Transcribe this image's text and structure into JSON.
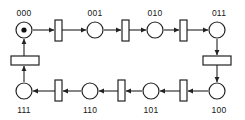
{
  "diagram": {
    "type": "petri-net",
    "background_color": "#ffffff",
    "stroke_color": "#222222",
    "token_color": "#111111",
    "arrow_color": "#222222"
  },
  "places": [
    {
      "id": "p000",
      "label": "000",
      "cx": 24,
      "cy": 30,
      "r": 8,
      "tokens": 1,
      "label_x": 24,
      "label_y": 16,
      "label_pos": "above"
    },
    {
      "id": "p001",
      "label": "001",
      "cx": 95,
      "cy": 30,
      "r": 8,
      "tokens": 0,
      "label_x": 95,
      "label_y": 16,
      "label_pos": "above"
    },
    {
      "id": "p010",
      "label": "010",
      "cx": 155,
      "cy": 30,
      "r": 8,
      "tokens": 0,
      "label_x": 155,
      "label_y": 16,
      "label_pos": "above"
    },
    {
      "id": "p011",
      "label": "011",
      "cx": 217,
      "cy": 30,
      "r": 8,
      "tokens": 0,
      "label_x": 219,
      "label_y": 16,
      "label_pos": "above"
    },
    {
      "id": "p100",
      "label": "100",
      "cx": 217,
      "cy": 91,
      "r": 8,
      "tokens": 0,
      "label_x": 219,
      "label_y": 113,
      "label_pos": "below"
    },
    {
      "id": "p101",
      "label": "101",
      "cx": 151,
      "cy": 91,
      "r": 8,
      "tokens": 0,
      "label_x": 151,
      "label_y": 113,
      "label_pos": "below"
    },
    {
      "id": "p110",
      "label": "110",
      "cx": 90,
      "cy": 91,
      "r": 8,
      "tokens": 0,
      "label_x": 90,
      "label_y": 113,
      "label_pos": "below"
    },
    {
      "id": "p111",
      "label": "111",
      "cx": 24,
      "cy": 91,
      "r": 8,
      "tokens": 0,
      "label_x": 24,
      "label_y": 113,
      "label_pos": "below"
    }
  ],
  "transitions": [
    {
      "id": "t0",
      "orientation": "vertical",
      "x": 55,
      "y": 20,
      "w": 7,
      "h": 21
    },
    {
      "id": "t1",
      "orientation": "vertical",
      "x": 122,
      "y": 20,
      "w": 7,
      "h": 21
    },
    {
      "id": "t2",
      "orientation": "vertical",
      "x": 180,
      "y": 20,
      "w": 7,
      "h": 21
    },
    {
      "id": "t3",
      "orientation": "horizontal",
      "x": 203,
      "y": 56,
      "w": 28,
      "h": 9
    },
    {
      "id": "t4",
      "orientation": "vertical",
      "x": 180,
      "y": 80,
      "w": 7,
      "h": 21
    },
    {
      "id": "t5",
      "orientation": "vertical",
      "x": 118,
      "y": 80,
      "w": 7,
      "h": 21
    },
    {
      "id": "t6",
      "orientation": "vertical",
      "x": 55,
      "y": 80,
      "w": 7,
      "h": 21
    },
    {
      "id": "t7",
      "orientation": "horizontal",
      "x": 11,
      "y": 56,
      "w": 28,
      "h": 9
    }
  ],
  "arcs": [
    {
      "id": "a1",
      "from": "p000",
      "to": "t0",
      "x1": 33,
      "y1": 30,
      "x2": 54,
      "y2": 30
    },
    {
      "id": "a2",
      "from": "t0",
      "to": "p001",
      "x1": 62,
      "y1": 30,
      "x2": 86,
      "y2": 30
    },
    {
      "id": "a3",
      "from": "p001",
      "to": "t1",
      "x1": 104,
      "y1": 30,
      "x2": 121,
      "y2": 30
    },
    {
      "id": "a4",
      "from": "t1",
      "to": "p010",
      "x1": 129,
      "y1": 30,
      "x2": 146,
      "y2": 30
    },
    {
      "id": "a5",
      "from": "p010",
      "to": "t2",
      "x1": 164,
      "y1": 30,
      "x2": 179,
      "y2": 30
    },
    {
      "id": "a6",
      "from": "t2",
      "to": "p011",
      "x1": 187,
      "y1": 30,
      "x2": 208,
      "y2": 30
    },
    {
      "id": "a7",
      "from": "p011",
      "to": "t3",
      "x1": 217,
      "y1": 39,
      "x2": 217,
      "y2": 55
    },
    {
      "id": "a8",
      "from": "t3",
      "to": "p100",
      "x1": 217,
      "y1": 65,
      "x2": 217,
      "y2": 82
    },
    {
      "id": "a9",
      "from": "p100",
      "to": "t4",
      "x1": 208,
      "y1": 91,
      "x2": 188,
      "y2": 91
    },
    {
      "id": "a10",
      "from": "t4",
      "to": "p101",
      "x1": 180,
      "y1": 91,
      "x2": 160,
      "y2": 91
    },
    {
      "id": "a11",
      "from": "p101",
      "to": "t5",
      "x1": 142,
      "y1": 91,
      "x2": 126,
      "y2": 91
    },
    {
      "id": "a12",
      "from": "t5",
      "to": "p110",
      "x1": 118,
      "y1": 91,
      "x2": 99,
      "y2": 91
    },
    {
      "id": "a13",
      "from": "p110",
      "to": "t6",
      "x1": 81,
      "y1": 91,
      "x2": 63,
      "y2": 91
    },
    {
      "id": "a14",
      "from": "t6",
      "to": "p111",
      "x1": 55,
      "y1": 91,
      "x2": 33,
      "y2": 91
    },
    {
      "id": "a15",
      "from": "p111",
      "to": "t7",
      "x1": 24,
      "y1": 82,
      "x2": 24,
      "y2": 66
    },
    {
      "id": "a16",
      "from": "t7",
      "to": "p000",
      "x1": 24,
      "y1": 56,
      "x2": 24,
      "y2": 39
    }
  ]
}
